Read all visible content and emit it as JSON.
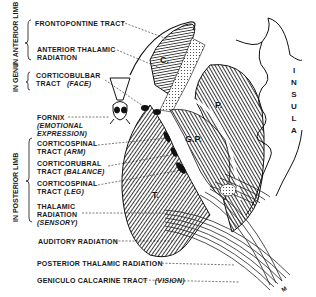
{
  "diagram": {
    "type": "anatomical-illustration",
    "groups": [
      {
        "label": "IN ANTERIOR LIMB",
        "items": [
          "frontopontine",
          "anterior_thalamic"
        ]
      },
      {
        "label": "IN GENU",
        "items": [
          "corticobulbar"
        ]
      },
      {
        "label": "IN POSTERIOR LIMB",
        "items": [
          "corticospinal_arm",
          "corticorubral",
          "corticospinal_leg",
          "thalamic_radiation"
        ]
      }
    ],
    "group_labels": {
      "anterior_limb": "IN ANTERIOR LIMB",
      "genu": "IN GENU",
      "posterior_limb": "IN POSTERIOR LIMB"
    },
    "labels": {
      "frontopontine": "FRONTOPONTINE TRACT",
      "anterior_thalamic_1": "ANTERIOR THALAMIC",
      "anterior_thalamic_2": "RADIATION",
      "corticobulbar_1": "CORTICOBULBAR",
      "corticobulbar_2": "TRACT",
      "corticobulbar_note": "(FACE)",
      "fornix": "FORNIX",
      "fornix_note_1": "(EMOTIONAL",
      "fornix_note_2": "EXPRESSION)",
      "corticospinal_arm_1": "CORTICOSPINAL",
      "corticospinal_arm_2": "TRACT",
      "corticospinal_arm_note": "(ARM)",
      "corticorubral_1": "CORTICORUBRAL",
      "corticorubral_2": "TRACT",
      "corticorubral_note": "(BALANCE)",
      "corticospinal_leg_1": "CORTICOSPINAL",
      "corticospinal_leg_2": "TRACT",
      "corticospinal_leg_note": "(LEG)",
      "thalamic_radiation_1": "THALAMIC",
      "thalamic_radiation_2": "RADIATION",
      "thalamic_radiation_note": "(SENSORY)",
      "auditory": "AUDITORY RADIATION",
      "posterior_thalamic": "POSTERIOR THALAMIC RADIATION",
      "geniculo_calcarine": "GENICULO CALCARINE TRACT",
      "geniculo_calcarine_note": "(VISION)"
    },
    "structures": {
      "caudate": "C.",
      "putamen": "P.",
      "globus_pallidus": "G.P.",
      "thalamus": "T."
    },
    "insula_letters": [
      "I",
      "N",
      "S",
      "U",
      "L",
      "A"
    ],
    "signature": "M"
  }
}
